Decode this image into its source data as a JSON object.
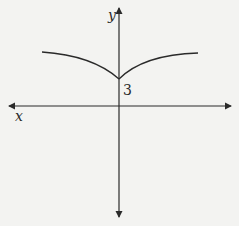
{
  "diagram": {
    "axes": {
      "x_label": "x",
      "y_label": "y"
    },
    "annotations": {
      "y_intercept_label": "3"
    },
    "colors": {
      "background": "#f3f3f1",
      "ink": "#2a2a2a"
    },
    "curve": {
      "description": "Cusp-shaped curve, symmetric about y-axis, minimum at y=3 on the y-axis, branches rising and flattening outward on both sides"
    }
  }
}
